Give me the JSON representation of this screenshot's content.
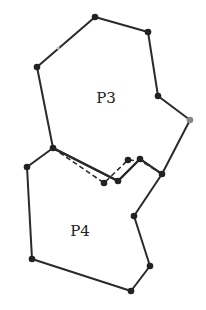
{
  "diagram": {
    "type": "polygon-partition",
    "stroke_color": "#2a2a2a",
    "vertex_color": "#222222",
    "faded_vertex_color": "#888888",
    "polygons": [
      {
        "id": "P3",
        "label": "P3",
        "label_pos": [
          106,
          103
        ],
        "vertices": [
          [
            95,
            17
          ],
          [
            148,
            32
          ],
          [
            158,
            96
          ],
          [
            190,
            120
          ],
          [
            162,
            174
          ],
          [
            140,
            159
          ],
          [
            118,
            181
          ],
          [
            53,
            148
          ],
          [
            37,
            67
          ]
        ]
      },
      {
        "id": "P4",
        "label": "P4",
        "label_pos": [
          80,
          236
        ],
        "vertices": [
          [
            53,
            148
          ],
          [
            118,
            181
          ],
          [
            140,
            159
          ],
          [
            162,
            174
          ],
          [
            134,
            216
          ],
          [
            150,
            266
          ],
          [
            131,
            291
          ],
          [
            32,
            259
          ],
          [
            27,
            167
          ]
        ]
      }
    ],
    "dashed_path": {
      "style": "dashed",
      "vertices": [
        [
          53,
          148
        ],
        [
          104,
          183
        ],
        [
          128,
          160
        ],
        [
          141,
          161
        ],
        [
          162,
          174
        ]
      ],
      "dot_points": [
        [
          104,
          183
        ],
        [
          128,
          160
        ]
      ]
    },
    "faded_points": [
      [
        190,
        120
      ],
      [
        58,
        48
      ]
    ]
  }
}
